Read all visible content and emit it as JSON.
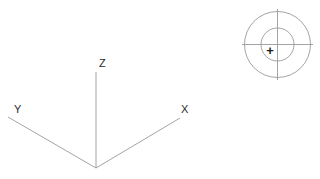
{
  "canvas": {
    "width": 320,
    "height": 179,
    "background": "#ffffff",
    "line_color": "#9a9a9a",
    "text_color": "#2b2b2b"
  },
  "diagram": {
    "axes": {
      "origin": {
        "x": 96,
        "y": 168
      },
      "items": [
        {
          "id": "z-axis",
          "label": "Z",
          "label_x": 99,
          "label_y": 67,
          "x1": 96,
          "y1": 72,
          "x2": 96,
          "y2": 168
        },
        {
          "id": "y-axis",
          "label": "Y",
          "label_x": 14,
          "label_y": 113,
          "x1": 8,
          "y1": 117,
          "x2": 96,
          "y2": 168
        },
        {
          "id": "x-axis",
          "label": "X",
          "label_x": 181,
          "label_y": 113,
          "x1": 96,
          "y1": 168,
          "x2": 180,
          "y2": 118
        }
      ]
    },
    "target": {
      "center_x": 277.5,
      "center_y": 44.5,
      "outer_radius": 33,
      "inner_radius": 16.5,
      "crosshair_h": {
        "x1": 242,
        "y1": 44.5,
        "x2": 313,
        "y2": 44.5
      },
      "crosshair_v": {
        "x1": 277.5,
        "y1": 9,
        "x2": 277.5,
        "y2": 80
      },
      "marker": "+",
      "marker_x": 270,
      "marker_y": 55
    }
  }
}
